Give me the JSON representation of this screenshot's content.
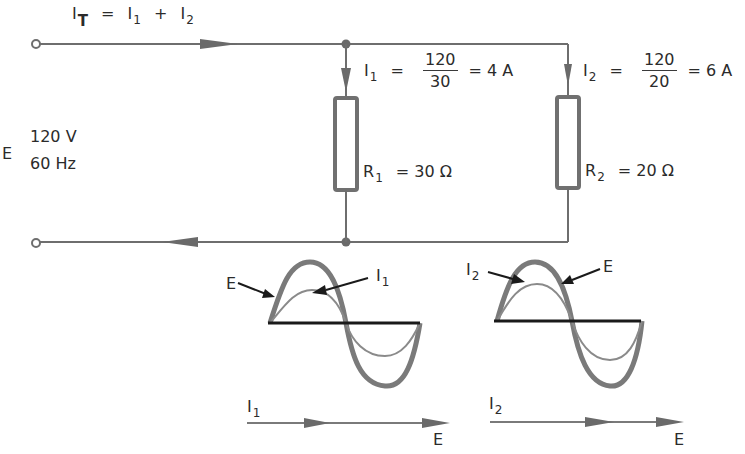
{
  "title_equation": {
    "lhs": "I",
    "lhs_sub": "T",
    "eq": "=",
    "t1": "I",
    "t1_sub": "1",
    "plus": "+",
    "t2": "I",
    "t2_sub": "2"
  },
  "source": {
    "symbol": "E",
    "voltage": "120 V",
    "frequency": "60 Hz"
  },
  "branch1": {
    "current_label": "I",
    "current_sub": "1",
    "eq": "=",
    "numerator": "120",
    "denominator": "30",
    "result": "= 4 A",
    "resistor_label": "R",
    "resistor_sub": "1",
    "resistor_value": "= 30 Ω"
  },
  "branch2": {
    "current_label": "I",
    "current_sub": "2",
    "eq": "=",
    "numerator": "120",
    "denominator": "20",
    "result": "= 6 A",
    "resistor_label": "R",
    "resistor_sub": "2",
    "resistor_value": "= 20 Ω"
  },
  "waveform1": {
    "voltage_label": "E",
    "current_label": "I",
    "current_sub": "1",
    "relationship": "in phase"
  },
  "waveform2": {
    "current_label": "I",
    "current_sub": "2",
    "voltage_label": "E",
    "relationship": "in phase"
  },
  "phasor1": {
    "current_label": "I",
    "current_sub": "1",
    "voltage_label": "E"
  },
  "phasor2": {
    "current_label": "I",
    "current_sub": "2",
    "voltage_label": "E"
  },
  "colors": {
    "wire": "#6e6e6e",
    "resistor": "#707070",
    "voltage_wave": "#7a7a7a",
    "current_wave": "#8a8a8a",
    "axis": "#1a1a1a",
    "text": "#2b2b2b"
  }
}
